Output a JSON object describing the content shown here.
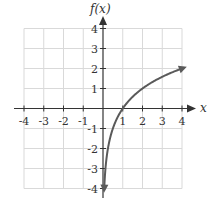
{
  "chart_data": {
    "type": "line",
    "title": "",
    "xlabel": "x",
    "ylabel": "f(x)",
    "xlim": [
      -4,
      4
    ],
    "ylim": [
      -4,
      4
    ],
    "grid": true,
    "x_ticks": [
      "-4",
      "-3",
      "-2",
      "-1",
      "1",
      "2",
      "3",
      "4"
    ],
    "y_ticks": [
      "4",
      "3",
      "2",
      "1",
      "-1",
      "-2",
      "-3",
      "-4"
    ],
    "series": [
      {
        "name": "f(x) = log2(x)",
        "x": [
          0.06,
          0.125,
          0.25,
          0.5,
          1,
          2,
          3,
          4,
          4.1
        ],
        "y": [
          -4.06,
          -3,
          -2,
          -1,
          0,
          1,
          1.585,
          2,
          2.04
        ],
        "arrows": "both ends",
        "color": "#5a5a5a"
      }
    ],
    "legend": "none"
  }
}
